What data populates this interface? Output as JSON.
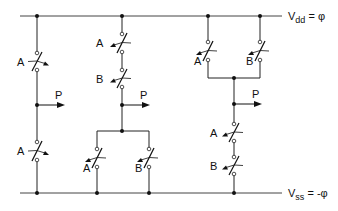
{
  "diagram": {
    "type": "CMOS-style switch logic network",
    "supply_top": {
      "label_main": "V",
      "label_sub": "dd",
      "label_rest": " = φ"
    },
    "supply_bottom": {
      "label_main": "V",
      "label_sub": "ss",
      "label_rest": " = -φ"
    },
    "output_label": "P",
    "colors": {
      "line": "#222222",
      "background": "#ffffff"
    },
    "circuits": [
      {
        "name": "inverter",
        "switches": [
          {
            "label": "A",
            "position": "pull-up"
          },
          {
            "label": "A",
            "position": "pull-down"
          }
        ],
        "output": "P"
      },
      {
        "name": "nand",
        "switches": [
          {
            "label": "A",
            "position": "pull-up series"
          },
          {
            "label": "B",
            "position": "pull-up series"
          },
          {
            "label": "A",
            "position": "pull-down parallel"
          },
          {
            "label": "B",
            "position": "pull-down parallel"
          }
        ],
        "output": "P"
      },
      {
        "name": "nor",
        "switches": [
          {
            "label": "A",
            "position": "pull-up parallel"
          },
          {
            "label": "B",
            "position": "pull-up parallel"
          },
          {
            "label": "A",
            "position": "pull-down series"
          },
          {
            "label": "B",
            "position": "pull-down series"
          }
        ],
        "output": "P"
      }
    ]
  }
}
